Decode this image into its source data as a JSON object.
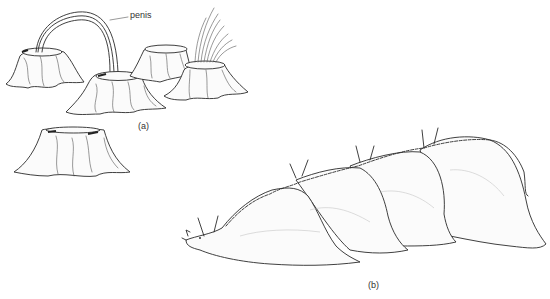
{
  "figure": {
    "panels": [
      {
        "id": "a",
        "label": "(a)",
        "subject": "barnacles",
        "annotation": "penis"
      },
      {
        "id": "b",
        "label": "(b)",
        "subject": "sea-hare-mating-chain"
      }
    ]
  },
  "colors": {
    "ink": "#2a2a2a",
    "background": "#ffffff"
  }
}
